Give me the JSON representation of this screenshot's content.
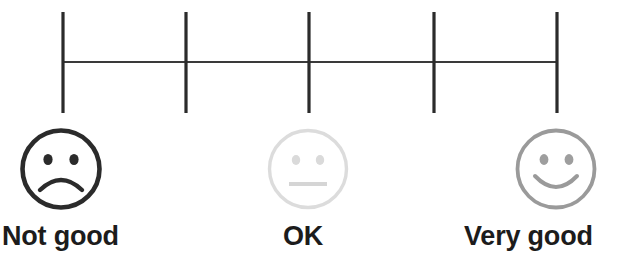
{
  "widget": {
    "name": "satisfaction-rating-scale",
    "type": "likert-scale",
    "points": 5,
    "background_color": "#ffffff"
  },
  "scale": {
    "axis_color": "#2b2b2b",
    "tick_count": 5,
    "tick_positions_x": [
      63,
      186,
      309,
      434,
      557
    ],
    "tick_top_y": 12,
    "tick_bottom_y": 113,
    "rail_y": 62,
    "tick_width": 3,
    "rail_width": 2
  },
  "options": [
    {
      "id": "not-good",
      "label": "Not good",
      "value": 1,
      "face": "frowning-face",
      "color": "#2b2b2b"
    },
    {
      "id": "ok",
      "label": "OK",
      "value": 3,
      "face": "neutral-face",
      "color": "#d8d8d8"
    },
    {
      "id": "very-good",
      "label": "Very good",
      "value": 5,
      "face": "smiling-face",
      "color": "#999999"
    }
  ],
  "colors": {
    "dark": "#2b2b2b",
    "light_gray": "#d8d8d8",
    "mid_gray": "#999999",
    "label_text": "#1c1c1c",
    "background": "#ffffff"
  }
}
